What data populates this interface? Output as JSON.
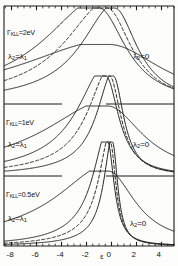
{
  "figure": {
    "title": "",
    "axis": {
      "x_label": "ε",
      "x_ticks": [
        "-8",
        "-6",
        "-4",
        "-2",
        "0",
        "2",
        "4"
      ],
      "x_tick_values": [
        -8,
        -6,
        -4,
        -2,
        0,
        2,
        4
      ],
      "x_min": -8.6,
      "x_max": 5.0,
      "y_label": ""
    },
    "panels": [
      {
        "id": "panel-top",
        "gamma_label_prefix": "Γ",
        "gamma_label_sub": "KLL",
        "gamma_label_value": "=2eV",
        "gamma_label_full": "ΓKLL=2eV",
        "left_curve_label": "λ",
        "left_curve_label_sub": "2",
        "left_curve_label_rest": "=λ",
        "left_curve_label_rest_sub": "1",
        "left_curve_label_full": "λ2=λ1",
        "right_curve_label": "λ",
        "right_curve_label_sub": "2",
        "right_curve_label_rest": "=0",
        "right_curve_label_full": "λ2=0"
      },
      {
        "id": "panel-middle",
        "gamma_label_prefix": "Γ",
        "gamma_label_sub": "KLL",
        "gamma_label_value": "=1eV",
        "gamma_label_full": "ΓKLL=1eV",
        "left_curve_label": "λ",
        "left_curve_label_sub": "2",
        "left_curve_label_rest": "=λ",
        "left_curve_label_rest_sub": "1",
        "left_curve_label_full": "λ2=λ1",
        "right_curve_label": "λ",
        "right_curve_label_sub": "2",
        "right_curve_label_rest": "=0",
        "right_curve_label_full": "λ2=0"
      },
      {
        "id": "panel-bottom",
        "gamma_label_prefix": "Γ",
        "gamma_label_sub": "KLL",
        "gamma_label_value": "=0.5eV",
        "gamma_label_full": "ΓKLL=0.5eV",
        "left_curve_label": "λ",
        "left_curve_label_sub": "2",
        "left_curve_label_rest": "=λ",
        "left_curve_label_rest_sub": "1",
        "left_curve_label_full": "λ2=λ1",
        "right_curve_label": "λ",
        "right_curve_label_sub": "2",
        "right_curve_label_rest": "=0",
        "right_curve_label_full": "λ2=0"
      }
    ]
  },
  "chart_data": {
    "type": "line",
    "title": "",
    "xlabel": "ε",
    "ylabel": "",
    "xlim": [
      -8.6,
      5.0
    ],
    "grid": false,
    "legend": "inline-annotations",
    "x_ticks": [
      -8,
      -6,
      -4,
      -2,
      0,
      2,
      4
    ],
    "x_minor_tick_step": 0.5,
    "panels": [
      {
        "name": "ΓKLL=2eV",
        "gamma_kll_eV": 2,
        "annotations": [
          "λ2=λ1",
          "λ2=0"
        ],
        "series": [
          {
            "name": "λ2=λ1",
            "style": "solid",
            "peak_x": -1.0,
            "width": 2.6,
            "height": 1.0,
            "asymmetry": 0.45
          },
          {
            "name": "intermediate",
            "style": "dashed",
            "peak_x": -0.35,
            "width": 2.35,
            "height": 1.0,
            "asymmetry": 0.32
          },
          {
            "name": "λ2=0",
            "style": "solid",
            "peak_x": 0.25,
            "width": 2.2,
            "height": 1.0,
            "asymmetry": 0.2
          },
          {
            "name": "broad-background",
            "style": "solid",
            "peak_x": -0.2,
            "width": 5.2,
            "height": 0.62,
            "asymmetry": 0.3
          }
        ]
      },
      {
        "name": "ΓKLL=1eV",
        "gamma_kll_eV": 1,
        "annotations": [
          "λ2=λ1",
          "λ2=0"
        ],
        "series": [
          {
            "name": "λ2=λ1",
            "style": "solid",
            "peak_x": -0.45,
            "width": 1.25,
            "height": 1.0,
            "asymmetry": 0.5
          },
          {
            "name": "intermediate",
            "style": "dashed",
            "peak_x": -0.15,
            "width": 1.1,
            "height": 1.0,
            "asymmetry": 0.38
          },
          {
            "name": "λ2=0",
            "style": "solid",
            "peak_x": 0.15,
            "width": 1.0,
            "height": 1.0,
            "asymmetry": 0.25
          },
          {
            "name": "broad-background",
            "style": "solid",
            "peak_x": -0.3,
            "width": 3.4,
            "height": 0.7,
            "asymmetry": 0.35
          }
        ]
      },
      {
        "name": "ΓKLL=0.5eV",
        "gamma_kll_eV": 0.5,
        "annotations": [
          "λ2=λ1",
          "λ2=0"
        ],
        "series": [
          {
            "name": "λ2=λ1",
            "style": "solid",
            "peak_x": -0.3,
            "width": 0.62,
            "height": 1.0,
            "asymmetry": 0.55
          },
          {
            "name": "intermediate",
            "style": "dashed",
            "peak_x": -0.1,
            "width": 0.55,
            "height": 1.0,
            "asymmetry": 0.42
          },
          {
            "name": "λ2=0",
            "style": "solid",
            "peak_x": 0.08,
            "width": 0.5,
            "height": 1.0,
            "asymmetry": 0.28
          },
          {
            "name": "broad-background",
            "style": "solid",
            "peak_x": -0.25,
            "width": 2.6,
            "height": 0.72,
            "asymmetry": 0.4
          }
        ]
      }
    ]
  },
  "colors": {
    "line": "#1b1b1b",
    "frame": "#1b1b1b",
    "background": "#fdfdfc"
  }
}
